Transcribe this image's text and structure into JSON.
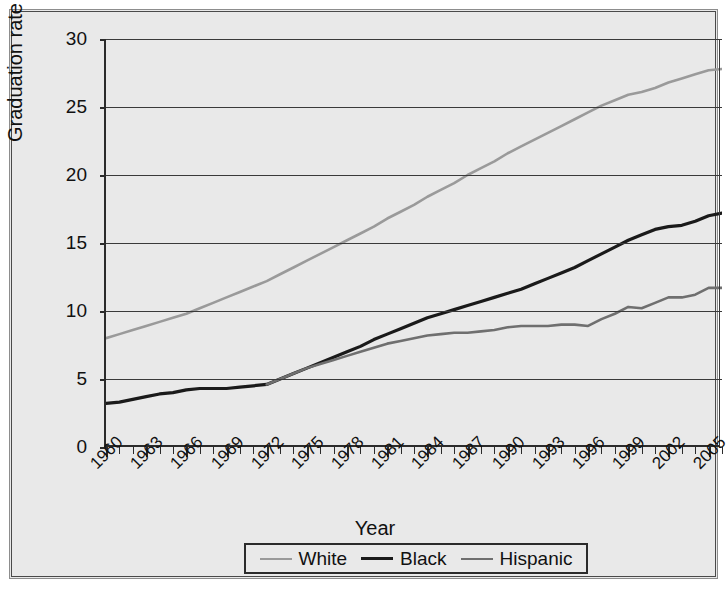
{
  "figure": {
    "caption_remnant": "",
    "background": "#e9e9e9"
  },
  "axis": {
    "ylabel": "Graduation rate",
    "xlabel": "Year",
    "yticks": [
      "0",
      "5",
      "10",
      "15",
      "20",
      "25",
      "30"
    ],
    "xticks": [
      "1960",
      "1963",
      "1966",
      "1969",
      "1972",
      "1975",
      "1978",
      "1981",
      "1984",
      "1987",
      "1990",
      "1993",
      "1996",
      "1999",
      "2002",
      "2005"
    ]
  },
  "legend": {
    "items": [
      {
        "label": "White",
        "color": "#9a9a9a"
      },
      {
        "label": "Black",
        "color": "#1a1a1a"
      },
      {
        "label": "Hispanic",
        "color": "#6f6f6f"
      }
    ]
  },
  "chart_data": {
    "type": "line",
    "title": "",
    "xlabel": "Year",
    "ylabel": "Graduation rate",
    "xlim": [
      1960,
      2006
    ],
    "ylim": [
      0,
      30
    ],
    "ytick_step": 5,
    "xtick_label_step": 3,
    "grid": true,
    "legend_position": "bottom",
    "x": [
      1960,
      1961,
      1962,
      1963,
      1964,
      1965,
      1966,
      1967,
      1968,
      1969,
      1970,
      1971,
      1972,
      1973,
      1974,
      1975,
      1976,
      1977,
      1978,
      1979,
      1980,
      1981,
      1982,
      1983,
      1984,
      1985,
      1986,
      1987,
      1988,
      1989,
      1990,
      1991,
      1992,
      1993,
      1994,
      1995,
      1996,
      1997,
      1998,
      1999,
      2000,
      2001,
      2002,
      2003,
      2004,
      2005,
      2006
    ],
    "series": [
      {
        "name": "White",
        "color": "#9a9a9a",
        "values": [
          8.0,
          8.3,
          8.6,
          8.9,
          9.2,
          9.5,
          9.8,
          10.2,
          10.6,
          11.0,
          11.4,
          11.8,
          12.2,
          12.7,
          13.2,
          13.7,
          14.2,
          14.7,
          15.2,
          15.7,
          16.2,
          16.8,
          17.3,
          17.8,
          18.4,
          18.9,
          19.4,
          20.0,
          20.5,
          21.0,
          21.6,
          22.1,
          22.6,
          23.1,
          23.6,
          24.1,
          24.6,
          25.1,
          25.5,
          25.9,
          26.1,
          26.4,
          26.8,
          27.1,
          27.4,
          27.7,
          27.8
        ]
      },
      {
        "name": "Black",
        "color": "#1a1a1a",
        "values": [
          3.2,
          3.3,
          3.5,
          3.7,
          3.9,
          4.0,
          4.2,
          4.3,
          4.3,
          4.3,
          4.4,
          4.5,
          4.6,
          5.0,
          5.4,
          5.8,
          6.2,
          6.6,
          7.0,
          7.4,
          7.9,
          8.3,
          8.7,
          9.1,
          9.5,
          9.8,
          10.1,
          10.4,
          10.7,
          11.0,
          11.3,
          11.6,
          12.0,
          12.4,
          12.8,
          13.2,
          13.7,
          14.2,
          14.7,
          15.2,
          15.6,
          16.0,
          16.2,
          16.3,
          16.6,
          17.0,
          17.2
        ]
      },
      {
        "name": "Hispanic",
        "color": "#6f6f6f",
        "values": [
          null,
          null,
          null,
          null,
          null,
          null,
          null,
          null,
          null,
          null,
          null,
          null,
          4.6,
          5.0,
          5.4,
          5.8,
          6.1,
          6.4,
          6.7,
          7.0,
          7.3,
          7.6,
          7.8,
          8.0,
          8.2,
          8.3,
          8.4,
          8.4,
          8.5,
          8.6,
          8.8,
          8.9,
          8.9,
          8.9,
          9.0,
          9.0,
          8.9,
          9.4,
          9.8,
          10.3,
          10.2,
          10.6,
          11.0,
          11.0,
          11.2,
          11.7,
          11.7
        ]
      }
    ]
  }
}
